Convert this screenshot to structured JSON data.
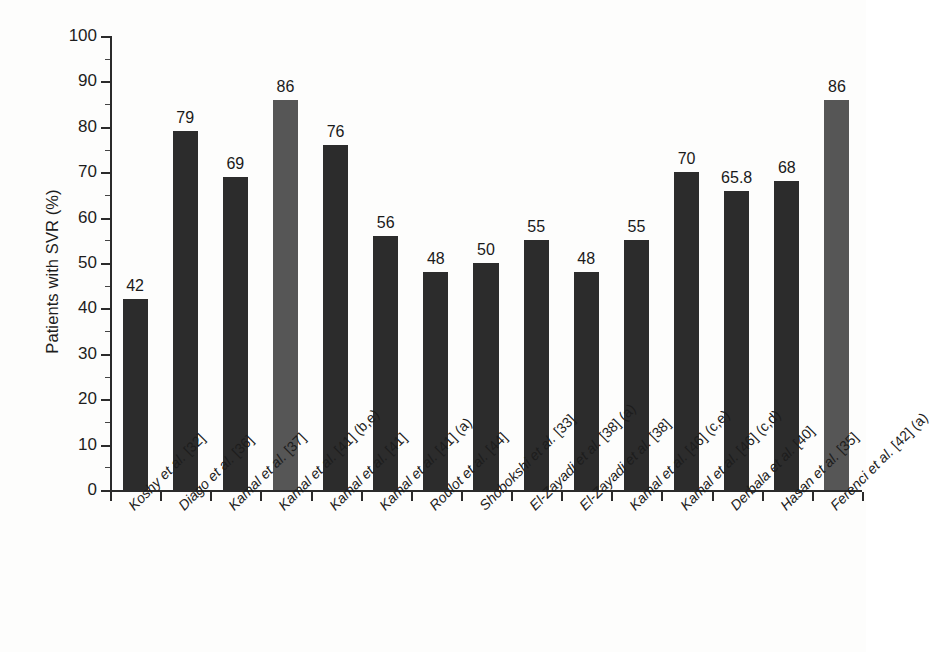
{
  "chart_data": {
    "type": "bar",
    "title": "",
    "xlabel": "",
    "ylabel": "Patients with SVR (%)",
    "ylim": [
      0,
      100
    ],
    "ytick_step": 10,
    "yminor_step": 5,
    "grid": false,
    "legend": "none",
    "yticks": [
      "0",
      "10",
      "20",
      "30",
      "40",
      "50",
      "60",
      "70",
      "80",
      "90",
      "100"
    ],
    "categories": [
      "Koshy et al. [32]",
      "Diago et al. [36]",
      "Kamal et al. [37]",
      "Kamal et al. [41] (b,e)",
      "Kamal et al. [41]",
      "Kamal et al. [41] (a)",
      "Roulot et al. [44]",
      "Shobokshi et al. [33]",
      "El-Zayadi et al. [38] (a)",
      "El-Zayadi et al. [38]",
      "Kamal et al. [46] (c,e)",
      "Kamal et al. [46] (c,d)",
      "Derbala et al. [40]",
      "Hasan et al. [35]",
      "Ferenci et al. [42] (a)"
    ],
    "values": [
      42,
      79,
      69,
      86,
      76,
      56,
      48,
      50,
      55,
      48,
      55,
      70,
      65.8,
      68,
      86
    ],
    "value_labels": [
      "42",
      "79",
      "69",
      "86",
      "76",
      "56",
      "48",
      "50",
      "55",
      "48",
      "55",
      "70",
      "65.8",
      "68",
      "86"
    ],
    "bar_styles": [
      "dark",
      "dark",
      "dark",
      "light",
      "dark",
      "dark",
      "dark",
      "dark",
      "dark",
      "dark",
      "dark",
      "dark",
      "dark",
      "dark",
      "light"
    ],
    "colors": {
      "bar_dark": "#2c2c2c",
      "bar_light": "#565656",
      "axis": "#2b2b2b",
      "text": "#1a1a1a",
      "background": "#fdfdfc"
    }
  }
}
